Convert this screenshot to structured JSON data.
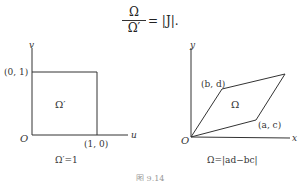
{
  "formula": {
    "numerator": "Ω",
    "denominator": "Ω′",
    "rhs": "= |J|."
  },
  "left_diagram": {
    "y_axis_label": "v",
    "x_axis_label": "u",
    "origin_label": "O",
    "point_top": "(0, 1)",
    "point_right": "(1, 0)",
    "region_label": "Ω′",
    "caption": "Ω′=1"
  },
  "right_diagram": {
    "y_axis_label": "y",
    "x_axis_label": "x",
    "origin_label": "O",
    "point_upper": "(b, d)",
    "point_lower": "(a, c)",
    "region_label": "Ω",
    "caption": "Ω=|ad−bc|"
  },
  "figure_caption": "图 9.14"
}
